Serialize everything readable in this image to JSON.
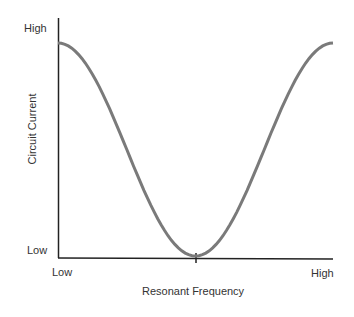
{
  "chart_data": {
    "type": "line",
    "title": "",
    "xlabel": "Resonant Frequency",
    "ylabel": "Circuit Current",
    "x_ticks": [
      "Low",
      "High"
    ],
    "y_ticks": [
      "Low",
      "High"
    ],
    "x": [
      0,
      0.1,
      0.2,
      0.3,
      0.4,
      0.5,
      0.6,
      0.7,
      0.8,
      0.9,
      1.0
    ],
    "series": [
      {
        "name": "Circuit Current",
        "values": [
          0.9,
          0.82,
          0.6,
          0.33,
          0.1,
          0.0,
          0.1,
          0.33,
          0.6,
          0.82,
          0.9
        ]
      }
    ],
    "curve_color": "#7a7a7a",
    "axis_color": "#222222",
    "grid": false,
    "legend": "none",
    "annotations": [
      "tick mark at minimum on x-axis"
    ]
  },
  "labels": {
    "y_high": "High",
    "y_low": "Low",
    "x_low": "Low",
    "x_high": "High",
    "x_axis_title": "Resonant Frequency",
    "y_axis_title": "Circuit Current"
  }
}
